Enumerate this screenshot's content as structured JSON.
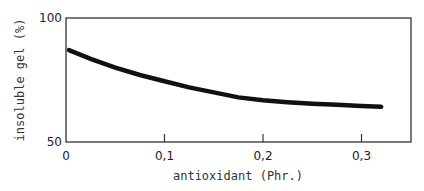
{
  "chart_data": {
    "type": "line",
    "title": "",
    "xlabel": "antioxidant (Phr.)",
    "ylabel": "insoluble gel (%)",
    "xlim": [
      0,
      0.35
    ],
    "ylim": [
      50,
      100
    ],
    "x_ticks": [
      "0",
      "0,1",
      "0,2",
      "0,3"
    ],
    "y_ticks": [
      "50",
      "100"
    ],
    "grid": false,
    "legend": null,
    "series": [
      {
        "name": "insoluble gel",
        "x": [
          0.0,
          0.025,
          0.05,
          0.075,
          0.1,
          0.125,
          0.15,
          0.175,
          0.2,
          0.225,
          0.25,
          0.275,
          0.3,
          0.32
        ],
        "y": [
          87,
          83.5,
          80,
          77,
          74.5,
          72,
          70,
          68,
          66.8,
          66,
          65.4,
          65,
          64.5,
          64.2
        ]
      }
    ]
  },
  "axes": {
    "x_label": "antioxidant (Phr.)",
    "y_label": "insoluble gel (%)",
    "x_tick_labels": [
      "0",
      "0,1",
      "0,2",
      "0,3"
    ],
    "y_tick_labels": [
      "50",
      "100"
    ]
  }
}
